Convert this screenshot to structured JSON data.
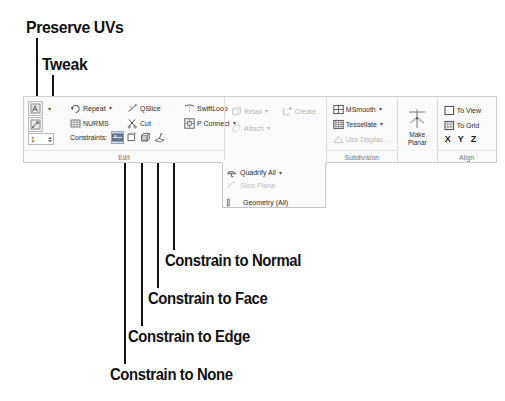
{
  "figure": {
    "type": "annotated-screenshot"
  },
  "callouts": [
    {
      "id": "preserve-uvs",
      "label": "Preserve UVs",
      "target": "preserve-uvs-button"
    },
    {
      "id": "tweak",
      "label": "Tweak",
      "target": "tweak-button"
    },
    {
      "id": "constrain-to-normal",
      "label": "Constrain to Normal",
      "target": "constraint-normal-button"
    },
    {
      "id": "constrain-to-face",
      "label": "Constrain to Face",
      "target": "constraint-face-button"
    },
    {
      "id": "constrain-to-edge",
      "label": "Constrain to Edge",
      "target": "constraint-edge-button"
    },
    {
      "id": "constrain-to-none",
      "label": "Constrain to None",
      "target": "constraint-none-button"
    }
  ],
  "ribbon": {
    "panels": [
      {
        "id": "edit",
        "label": "Edit",
        "spinner_value": "1",
        "constraints_label": "Constraints:",
        "commands": [
          {
            "label": "Repeat",
            "icon": "repeat-icon",
            "caret": true,
            "enabled": true
          },
          {
            "label": "QSlice",
            "icon": "qslice-icon",
            "caret": false,
            "enabled": true
          },
          {
            "label": "SwiftLoop",
            "icon": "swiftloop-icon",
            "caret": false,
            "enabled": true
          },
          {
            "label": "NURMS",
            "icon": "nurms-icon",
            "caret": false,
            "enabled": true
          },
          {
            "label": "Cut",
            "icon": "cut-icon",
            "caret": false,
            "enabled": true
          },
          {
            "label": "P Connect",
            "icon": "pconnect-icon",
            "caret": true,
            "enabled": true
          }
        ],
        "constraints": [
          {
            "id": "constraint-none-button",
            "icon": "constrain-none-icon",
            "selected": true
          },
          {
            "id": "constraint-edge-button",
            "icon": "constrain-edge-icon",
            "selected": false
          },
          {
            "id": "constraint-face-button",
            "icon": "constrain-face-icon",
            "selected": false
          },
          {
            "id": "constraint-normal-button",
            "icon": "constrain-normal-icon",
            "selected": false
          }
        ]
      },
      {
        "id": "edit-geometry",
        "label": "",
        "commands": [
          {
            "label": "Relax",
            "icon": "relax-icon",
            "caret": true,
            "enabled": false
          },
          {
            "label": "Attach",
            "icon": "attach-icon",
            "caret": true,
            "enabled": false
          },
          {
            "label": "Create",
            "icon": "create-icon",
            "caret": false,
            "enabled": false
          }
        ]
      },
      {
        "id": "subdivision",
        "label": "Subdivision",
        "commands": [
          {
            "label": "MSmooth",
            "icon": "msmooth-icon",
            "caret": true,
            "enabled": true
          },
          {
            "label": "Tessellate",
            "icon": "tessellate-icon",
            "caret": true,
            "enabled": true
          },
          {
            "label": "Use Displac…",
            "icon": "displace-icon",
            "caret": false,
            "enabled": false
          }
        ]
      },
      {
        "id": "make-planar",
        "label": "",
        "button": {
          "label": "Make\nPlanar",
          "line1": "Make",
          "line2": "Planar",
          "icon": "make-planar-icon"
        }
      },
      {
        "id": "align",
        "label": "Align",
        "commands": [
          {
            "label": "To View",
            "icon": "to-view-icon",
            "caret": false,
            "enabled": true
          },
          {
            "label": "To Grid",
            "icon": "to-grid-icon",
            "caret": false,
            "enabled": true
          }
        ],
        "axes": [
          "X",
          "Y",
          "Z"
        ]
      }
    ]
  },
  "flyout": {
    "items": [
      {
        "label": "Quadrify All",
        "icon": "quadrify-icon",
        "caret": true,
        "enabled": true
      },
      {
        "label": "Slice Plane",
        "icon": "slice-plane-icon",
        "caret": false,
        "enabled": false
      },
      {
        "label": "Geometry (All)",
        "icon": "geometry-all-icon",
        "caret": false,
        "enabled": true
      }
    ]
  },
  "colors": {
    "ribbon_bg": "#fbfbfb",
    "ribbon_border": "#cfcfcf",
    "text": "#2b2b2b",
    "disabled_text": "#b4b4b4",
    "selected_highlight": "#cfd9e6",
    "leader_line": "#111111"
  }
}
